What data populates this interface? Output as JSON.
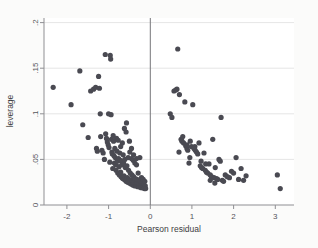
{
  "figure": {
    "background_color": "#fbfbfa",
    "plot_background_color": "#ffffff",
    "marker_color": "#4a4a52",
    "axis_color": "#8f8f93",
    "grid_color": "#dedede"
  },
  "chart_data": {
    "type": "scatter",
    "title": "",
    "xlabel": "Pearson residual",
    "ylabel": "leverage",
    "xlim": [
      -2.55,
      3.45
    ],
    "ylim": [
      0,
      0.205
    ],
    "grid": true,
    "legend": null,
    "xticks": [
      -2,
      -1,
      0,
      1,
      2,
      3
    ],
    "xtick_labels": [
      "-2",
      "-1",
      "0",
      "1",
      "2",
      "3"
    ],
    "yticks": [
      0,
      0.05,
      0.1,
      0.15,
      0.2
    ],
    "ytick_labels": [
      "0",
      ".05",
      ".1",
      ".15",
      ".2"
    ],
    "annotations": [
      {
        "type": "vline",
        "x": 0,
        "label": "zero-residual reference line"
      }
    ],
    "marker_size": 2.6,
    "points": [
      [
        -2.33,
        0.129
      ],
      [
        -1.9,
        0.11
      ],
      [
        -1.69,
        0.147
      ],
      [
        -1.62,
        0.088
      ],
      [
        -1.49,
        0.074
      ],
      [
        -1.43,
        0.125
      ],
      [
        -1.36,
        0.127
      ],
      [
        -1.31,
        0.129
      ],
      [
        -1.29,
        0.062
      ],
      [
        -1.27,
        0.059
      ],
      [
        -1.24,
        0.141
      ],
      [
        -1.22,
        0.128
      ],
      [
        -1.2,
        0.1
      ],
      [
        -1.19,
        0.075
      ],
      [
        -1.16,
        0.06
      ],
      [
        -1.13,
        0.057
      ],
      [
        -1.1,
        0.05
      ],
      [
        -1.08,
        0.165
      ],
      [
        -1.07,
        0.078
      ],
      [
        -1.05,
        0.073
      ],
      [
        -1.03,
        0.069
      ],
      [
        -1.01,
        0.066
      ],
      [
        -1.0,
        0.1
      ],
      [
        -0.99,
        0.063
      ],
      [
        -0.97,
        0.047
      ],
      [
        -0.96,
        0.164
      ],
      [
        -0.95,
        0.16
      ],
      [
        -0.94,
        0.099
      ],
      [
        -0.93,
        0.072
      ],
      [
        -0.92,
        0.058
      ],
      [
        -0.91,
        0.056
      ],
      [
        -0.9,
        0.04
      ],
      [
        -0.89,
        0.076
      ],
      [
        -0.88,
        0.07
      ],
      [
        -0.87,
        0.054
      ],
      [
        -0.86,
        0.046
      ],
      [
        -0.85,
        0.062
      ],
      [
        -0.84,
        0.052
      ],
      [
        -0.83,
        0.044
      ],
      [
        -0.82,
        0.038
      ],
      [
        -0.81,
        0.073
      ],
      [
        -0.8,
        0.059
      ],
      [
        -0.79,
        0.048
      ],
      [
        -0.78,
        0.035
      ],
      [
        -0.77,
        0.071
      ],
      [
        -0.76,
        0.051
      ],
      [
        -0.75,
        0.042
      ],
      [
        -0.74,
        0.033
      ],
      [
        -0.73,
        0.057
      ],
      [
        -0.72,
        0.049
      ],
      [
        -0.71,
        0.036
      ],
      [
        -0.7,
        0.031
      ],
      [
        -0.69,
        0.048
      ],
      [
        -0.68,
        0.044
      ],
      [
        -0.67,
        0.03
      ],
      [
        -0.66,
        0.029
      ],
      [
        -0.65,
        0.055
      ],
      [
        -0.64,
        0.046
      ],
      [
        -0.63,
        0.032
      ],
      [
        -0.62,
        0.028
      ],
      [
        -0.61,
        0.05
      ],
      [
        -0.6,
        0.041
      ],
      [
        -0.59,
        0.027
      ],
      [
        -0.58,
        0.026
      ],
      [
        -0.57,
        0.09
      ],
      [
        -0.56,
        0.043
      ],
      [
        -0.55,
        0.03
      ],
      [
        -0.54,
        0.025
      ],
      [
        -0.53,
        0.052
      ],
      [
        -0.52,
        0.038
      ],
      [
        -0.51,
        0.028
      ],
      [
        -0.5,
        0.024
      ],
      [
        -0.49,
        0.058
      ],
      [
        -0.48,
        0.035
      ],
      [
        -0.47,
        0.027
      ],
      [
        -0.46,
        0.023
      ],
      [
        -0.45,
        0.051
      ],
      [
        -0.44,
        0.033
      ],
      [
        -0.43,
        0.026
      ],
      [
        -0.42,
        0.022
      ],
      [
        -0.41,
        0.049
      ],
      [
        -0.4,
        0.031
      ],
      [
        -0.39,
        0.025
      ],
      [
        -0.38,
        0.021
      ],
      [
        -0.37,
        0.046
      ],
      [
        -0.36,
        0.029
      ],
      [
        -0.35,
        0.024
      ],
      [
        -0.34,
        0.021
      ],
      [
        -0.33,
        0.044
      ],
      [
        -0.32,
        0.028
      ],
      [
        -0.31,
        0.023
      ],
      [
        -0.3,
        0.02
      ],
      [
        -0.29,
        0.035
      ],
      [
        -0.28,
        0.027
      ],
      [
        -0.27,
        0.022
      ],
      [
        -0.26,
        0.02
      ],
      [
        -0.25,
        0.052
      ],
      [
        -0.24,
        0.026
      ],
      [
        -0.23,
        0.021
      ],
      [
        -0.22,
        0.019
      ],
      [
        -0.21,
        0.03
      ],
      [
        -0.2,
        0.024
      ],
      [
        -0.19,
        0.02
      ],
      [
        -0.18,
        0.019
      ],
      [
        -0.17,
        0.028
      ],
      [
        -0.16,
        0.023
      ],
      [
        -0.15,
        0.019
      ],
      [
        -0.14,
        0.018
      ],
      [
        -0.13,
        0.026
      ],
      [
        -0.12,
        0.021
      ],
      [
        -0.11,
        0.018
      ],
      [
        -0.62,
        0.084
      ],
      [
        -0.58,
        0.08
      ],
      [
        -0.67,
        0.068
      ],
      [
        -0.71,
        0.064
      ],
      [
        -0.45,
        0.062
      ],
      [
        -0.4,
        0.055
      ],
      [
        -0.5,
        0.07
      ],
      [
        -0.33,
        0.051
      ],
      [
        0.48,
        0.1
      ],
      [
        0.52,
        0.096
      ],
      [
        0.57,
        0.125
      ],
      [
        0.61,
        0.126
      ],
      [
        0.64,
        0.127
      ],
      [
        0.66,
        0.171
      ],
      [
        0.7,
        0.121
      ],
      [
        0.74,
        0.072
      ],
      [
        0.76,
        0.07
      ],
      [
        0.78,
        0.075
      ],
      [
        0.8,
        0.068
      ],
      [
        0.83,
        0.113
      ],
      [
        0.85,
        0.065
      ],
      [
        0.88,
        0.062
      ],
      [
        0.9,
        0.06
      ],
      [
        0.93,
        0.046
      ],
      [
        0.96,
        0.07
      ],
      [
        0.99,
        0.064
      ],
      [
        1.02,
        0.11
      ],
      [
        1.05,
        0.062
      ],
      [
        1.08,
        0.06
      ],
      [
        1.11,
        0.058
      ],
      [
        1.14,
        0.056
      ],
      [
        1.17,
        0.068
      ],
      [
        1.2,
        0.043
      ],
      [
        1.23,
        0.041
      ],
      [
        1.26,
        0.04
      ],
      [
        1.29,
        0.057
      ],
      [
        1.32,
        0.038
      ],
      [
        1.35,
        0.036
      ],
      [
        1.38,
        0.035
      ],
      [
        1.41,
        0.045
      ],
      [
        1.44,
        0.033
      ],
      [
        1.47,
        0.031
      ],
      [
        1.5,
        0.072
      ],
      [
        1.53,
        0.03
      ],
      [
        1.56,
        0.041
      ],
      [
        1.59,
        0.029
      ],
      [
        1.62,
        0.028
      ],
      [
        1.65,
        0.05
      ],
      [
        1.68,
        0.048
      ],
      [
        1.7,
        0.096
      ],
      [
        1.73,
        0.027
      ],
      [
        1.76,
        0.026
      ],
      [
        1.8,
        0.033
      ],
      [
        1.85,
        0.031
      ],
      [
        1.9,
        0.03
      ],
      [
        1.95,
        0.037
      ],
      [
        2.0,
        0.035
      ],
      [
        2.06,
        0.052
      ],
      [
        2.12,
        0.028
      ],
      [
        2.18,
        0.04
      ],
      [
        2.24,
        0.027
      ],
      [
        2.3,
        0.032
      ],
      [
        3.05,
        0.033
      ],
      [
        3.12,
        0.018
      ],
      [
        0.88,
        0.066
      ],
      [
        1.07,
        0.064
      ],
      [
        1.44,
        0.027
      ],
      [
        1.55,
        0.024
      ],
      [
        1.22,
        0.048
      ],
      [
        0.95,
        0.052
      ],
      [
        0.69,
        0.058
      ],
      [
        1.33,
        0.045
      ]
    ]
  }
}
